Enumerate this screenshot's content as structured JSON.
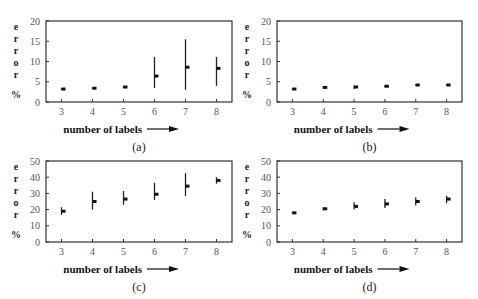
{
  "figure": {
    "panels": [
      "a",
      "b",
      "c",
      "d"
    ]
  },
  "chart_data": [
    {
      "id": "a",
      "type": "errorbar",
      "caption": "(a)",
      "xlabel": "number of labels",
      "ylabel_letters": [
        "e",
        "r",
        "r",
        "o",
        "r",
        "%"
      ],
      "ylabel": "error %",
      "x": [
        3,
        4,
        5,
        6,
        7,
        8
      ],
      "y": [
        3.2,
        3.4,
        3.7,
        6.4,
        8.6,
        8.3
      ],
      "y_low": [
        3.0,
        3.2,
        3.4,
        3.5,
        3.0,
        4.0
      ],
      "y_high": [
        3.4,
        3.6,
        4.0,
        11.1,
        15.5,
        11.1
      ],
      "ylim": [
        0,
        20
      ],
      "yticks": [
        0,
        5,
        10,
        15,
        20
      ],
      "xticks": [
        3,
        4,
        5,
        6,
        7,
        8
      ],
      "frame": {
        "x0": 46,
        "x1": 232,
        "y0": 21,
        "y1": 102
      },
      "grid": false
    },
    {
      "id": "b",
      "type": "errorbar",
      "caption": "(b)",
      "xlabel": "number of labels",
      "ylabel_letters": [
        "e",
        "r",
        "r",
        "o",
        "r",
        "%"
      ],
      "ylabel": "error %",
      "x": [
        3,
        4,
        5,
        6,
        7,
        8
      ],
      "y": [
        3.2,
        3.6,
        3.7,
        3.9,
        4.2,
        4.2
      ],
      "y_low": [
        3.0,
        3.3,
        3.2,
        3.6,
        4.0,
        4.0
      ],
      "y_high": [
        3.4,
        3.9,
        4.1,
        4.2,
        4.4,
        4.4
      ],
      "ylim": [
        0,
        20
      ],
      "yticks": [
        0,
        5,
        10,
        15,
        20
      ],
      "xticks": [
        3,
        4,
        5,
        6,
        7,
        8
      ],
      "frame": {
        "x0": 277,
        "x1": 462,
        "y0": 21,
        "y1": 102
      },
      "grid": false
    },
    {
      "id": "c",
      "type": "errorbar",
      "caption": "(c)",
      "xlabel": "number of labels",
      "ylabel_letters": [
        "e",
        "r",
        "r",
        "o",
        "r",
        "%"
      ],
      "ylabel": "error %",
      "x": [
        3,
        4,
        5,
        6,
        7,
        8
      ],
      "y": [
        19,
        25,
        26.5,
        29.5,
        34.5,
        38
      ],
      "y_low": [
        16.7,
        20,
        23,
        26,
        28.5,
        36
      ],
      "y_high": [
        21.5,
        31,
        31.5,
        36.5,
        42.5,
        40
      ],
      "ylim": [
        0,
        50
      ],
      "yticks": [
        0,
        10,
        20,
        30,
        40,
        50
      ],
      "xticks": [
        3,
        4,
        5,
        6,
        7,
        8
      ],
      "frame": {
        "x0": 46,
        "x1": 232,
        "y0": 161,
        "y1": 242
      },
      "grid": false
    },
    {
      "id": "d",
      "type": "errorbar",
      "caption": "(d)",
      "xlabel": "number of labels",
      "ylabel_letters": [
        "e",
        "r",
        "r",
        "o",
        "r",
        "%"
      ],
      "ylabel": "error %",
      "x": [
        3,
        4,
        5,
        6,
        7,
        8
      ],
      "y": [
        18,
        20.5,
        22,
        23.5,
        25,
        26.5
      ],
      "y_low": [
        17.5,
        19.5,
        20,
        21,
        22.5,
        24
      ],
      "y_high": [
        18.5,
        21.5,
        24.5,
        26.5,
        27.5,
        28.5
      ],
      "ylim": [
        0,
        50
      ],
      "yticks": [
        0,
        10,
        20,
        30,
        40,
        50
      ],
      "xticks": [
        3,
        4,
        5,
        6,
        7,
        8
      ],
      "frame": {
        "x0": 277,
        "x1": 462,
        "y0": 161,
        "y1": 242
      },
      "grid": false
    }
  ]
}
